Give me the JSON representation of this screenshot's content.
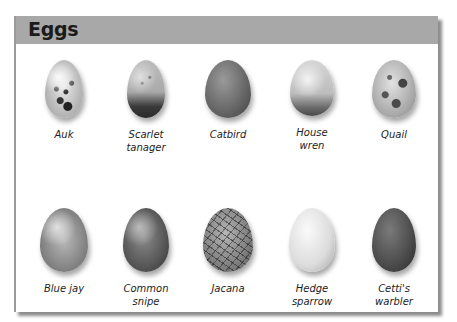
{
  "header": {
    "title": "Eggs",
    "background_color": "#a8a8a8"
  },
  "eggs": [
    {
      "name_line1": "Auk",
      "name_line2": "",
      "style": "speckled white with dark blotches"
    },
    {
      "name_line1": "Scarlet",
      "name_line2": "tanager",
      "style": "pale with dark speckled base"
    },
    {
      "name_line1": "Catbird",
      "name_line2": "",
      "style": "plain dark"
    },
    {
      "name_line1": "House",
      "name_line2": "wren",
      "style": "pale speckled with dark base"
    },
    {
      "name_line1": "Quail",
      "name_line2": "",
      "style": "pale with dark blotches"
    },
    {
      "name_line1": "Blue jay",
      "name_line2": "",
      "style": "mottled"
    },
    {
      "name_line1": "Common",
      "name_line2": "snipe",
      "style": "dark mottled"
    },
    {
      "name_line1": "Jacana",
      "name_line2": "",
      "style": "scribbled lines"
    },
    {
      "name_line1": "Hedge",
      "name_line2": "sparrow",
      "style": "plain pale"
    },
    {
      "name_line1": "Cetti's",
      "name_line2": "warbler",
      "style": "plain dark glossy"
    }
  ]
}
